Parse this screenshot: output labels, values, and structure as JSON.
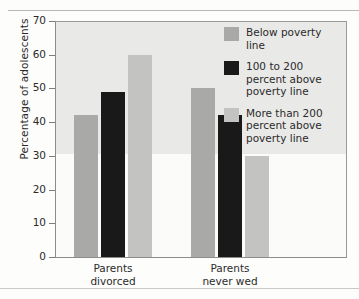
{
  "chart_data": {
    "type": "bar",
    "title": "",
    "subtitle": "",
    "xlabel": "",
    "ylabel": "Percentage of adolescents",
    "categories": [
      "Parents divorced",
      "Parents never wed"
    ],
    "category_lines": [
      [
        "Parents",
        "divorced"
      ],
      [
        "Parents",
        "never wed"
      ]
    ],
    "series": [
      {
        "name": "Below poverty line",
        "name_lines": [
          "Below poverty",
          "line"
        ],
        "color": "#a9a9a7",
        "values": [
          42,
          50
        ]
      },
      {
        "name": "100 to 200 percent above poverty line",
        "name_lines": [
          "100 to 200",
          "percent above",
          "poverty line"
        ],
        "color": "#191919",
        "values": [
          49,
          42
        ]
      },
      {
        "name": "More than 200 percent above poverty line",
        "name_lines": [
          "More than 200",
          "percent above",
          "poverty line"
        ],
        "color": "#c3c3c1",
        "values": [
          60,
          30
        ]
      }
    ],
    "ylim": [
      0,
      70
    ],
    "yticks": [
      0,
      10,
      20,
      30,
      40,
      50,
      60,
      70
    ],
    "ytick_labels": [
      "0",
      "10",
      "20",
      "30",
      "40",
      "50",
      "60",
      "70"
    ],
    "grid": false,
    "legend_position": "inside-top-right",
    "plot_background": "#e9e9e7"
  }
}
